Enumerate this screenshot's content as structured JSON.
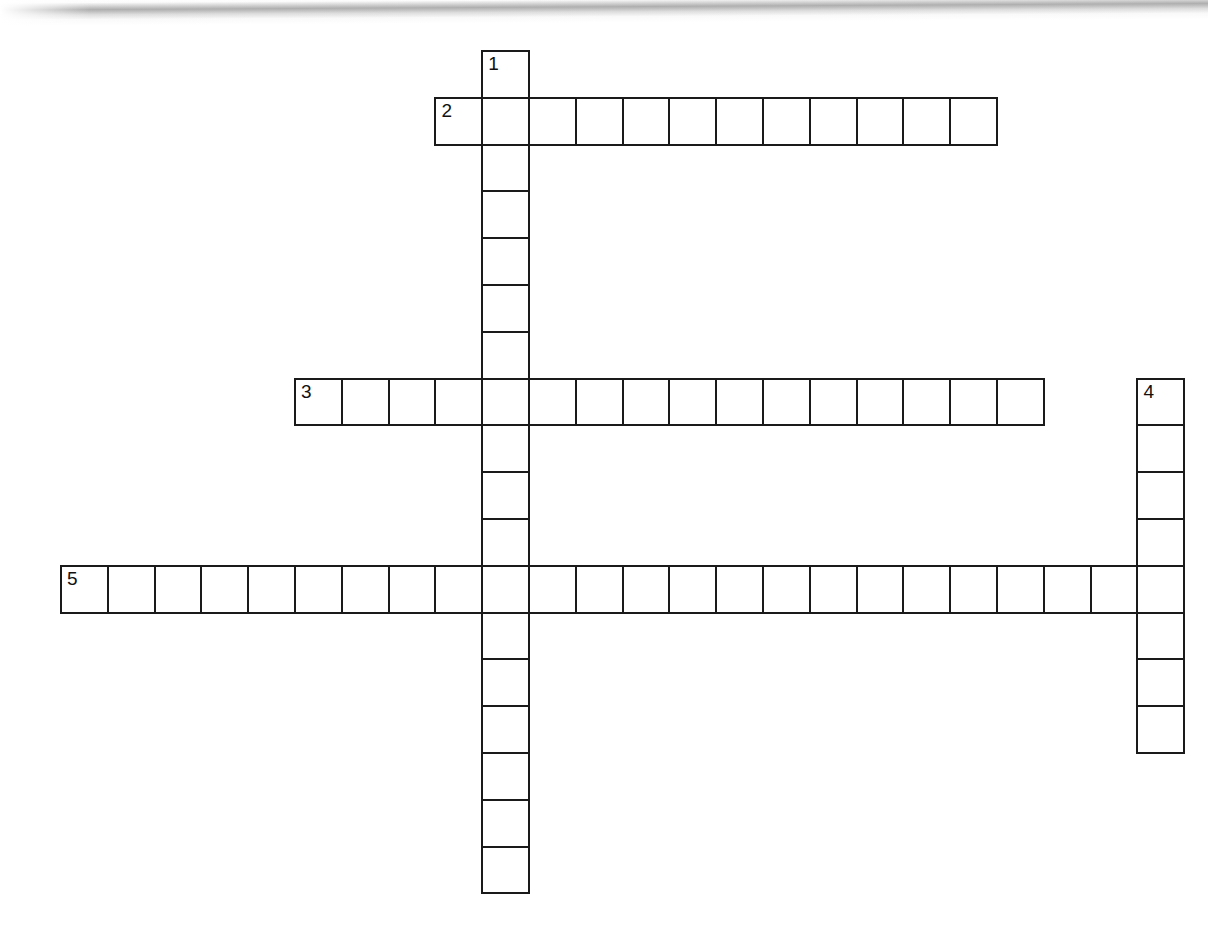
{
  "page": {
    "type": "crossword-puzzle-worksheet",
    "background_color": "#ffffff",
    "ink_color": "#1a1a1a",
    "width": 1208,
    "height": 939
  },
  "scan_artifact": {
    "name": "page-scan-shadow",
    "color": "#8c8c8c",
    "position": "top-edge"
  },
  "grid": {
    "cell_size": 46.8,
    "origin_x": 60,
    "origin_y": 50,
    "columns": 24,
    "rows": 18,
    "border_width": 2,
    "cell_fill": "#ffffff",
    "cell_border_color": "#1a1a1a"
  },
  "entries": [
    {
      "number": "1",
      "direction": "down",
      "length": 18,
      "start_col": 9,
      "start_row": 0,
      "name": "entry-1-down"
    },
    {
      "number": "2",
      "direction": "across",
      "length": 12,
      "start_col": 8,
      "start_row": 1,
      "name": "entry-2-across"
    },
    {
      "number": "3",
      "direction": "across",
      "length": 16,
      "start_col": 5,
      "start_row": 7,
      "name": "entry-3-across"
    },
    {
      "number": "4",
      "direction": "down",
      "length": 8,
      "start_col": 23,
      "start_row": 7,
      "name": "entry-4-down"
    },
    {
      "number": "5",
      "direction": "across",
      "length": 24,
      "start_col": 0,
      "start_row": 11,
      "name": "entry-5-across"
    }
  ],
  "numbered_cells": [
    {
      "number": "1",
      "col": 9,
      "row": 0
    },
    {
      "number": "2",
      "col": 8,
      "row": 1
    },
    {
      "number": "3",
      "col": 5,
      "row": 7
    },
    {
      "number": "4",
      "col": 23,
      "row": 7
    },
    {
      "number": "5",
      "col": 0,
      "row": 11
    }
  ],
  "answers": {}
}
